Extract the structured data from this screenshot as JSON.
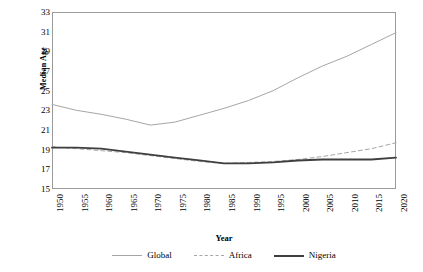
{
  "chart_data": {
    "type": "line",
    "title": "",
    "xlabel": "Year",
    "ylabel": "Median Age",
    "xlim": [
      1950,
      2020
    ],
    "ylim": [
      15,
      33
    ],
    "grid": false,
    "legend_position": "bottom",
    "categories": [
      1950,
      1955,
      1960,
      1965,
      1970,
      1975,
      1980,
      1985,
      1990,
      1995,
      2000,
      2005,
      2010,
      2015,
      2020
    ],
    "x_ticks": [
      "1950",
      "1955",
      "1960",
      "1965",
      "1970",
      "1975",
      "1980",
      "1985",
      "1990",
      "1995",
      "2000",
      "2005",
      "2010",
      "2015",
      "2020"
    ],
    "y_ticks": [
      "15",
      "17",
      "19",
      "21",
      "23",
      "25",
      "27",
      "29",
      "31",
      "33"
    ],
    "series": [
      {
        "name": "Global",
        "color": "#a6a6a6",
        "style": "solid-thin",
        "values": [
          23.6,
          23.0,
          22.6,
          22.1,
          21.5,
          21.8,
          22.5,
          23.2,
          24.0,
          25.0,
          26.3,
          27.5,
          28.5,
          29.7,
          30.9
        ]
      },
      {
        "name": "Africa",
        "color": "#a6a6a6",
        "style": "dashed",
        "values": [
          19.3,
          19.1,
          18.9,
          18.7,
          18.4,
          18.1,
          17.8,
          17.6,
          17.7,
          17.8,
          18.0,
          18.3,
          18.7,
          19.1,
          19.7
        ]
      },
      {
        "name": "Nigeria",
        "color": "#3f3f3f",
        "style": "solid-thick",
        "values": [
          19.2,
          19.2,
          19.1,
          18.8,
          18.5,
          18.2,
          17.9,
          17.6,
          17.6,
          17.7,
          17.9,
          18.0,
          18.0,
          18.0,
          18.2
        ]
      }
    ],
    "legend": [
      {
        "label": "Global",
        "style": "solid-thin"
      },
      {
        "label": "Africa",
        "style": "dashed"
      },
      {
        "label": "Nigeria",
        "style": "solid-thick"
      }
    ]
  }
}
